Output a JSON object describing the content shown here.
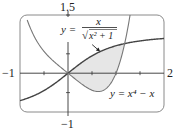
{
  "chart_data": {
    "type": "line",
    "title": "",
    "xlabel": "",
    "ylabel": "",
    "xlim": [
      -1,
      2
    ],
    "ylim": [
      -1,
      1.5
    ],
    "grid": false,
    "tick_step": 0.5,
    "tick_labels": {
      "x_left": "−1",
      "x_right": "2",
      "y_top": "1.5",
      "y_bottom": "−1"
    },
    "series": [
      {
        "name": "y = x / √(x²+1)",
        "expr": "x/sqrt(x^2+1)",
        "color": "#444444",
        "domain": [
          -1,
          2
        ]
      },
      {
        "name": "y = x⁴ − x",
        "expr": "x^4-x",
        "color": "#777777",
        "domain": [
          -0.85,
          1.33
        ]
      }
    ],
    "shaded_region": {
      "between": [
        "x/sqrt(x^2+1)",
        "x^4-x"
      ],
      "x_from": 0,
      "x_to": 1.18,
      "color": "#e6e6e6"
    },
    "annotations": [
      {
        "id": "label1",
        "text_parts": {
          "lhs": "y =",
          "num": "x",
          "den_rad": "√",
          "den_body": "x² + 1"
        },
        "arrow_to_x": 0.67
      },
      {
        "id": "label2",
        "text": "y = x⁴ − x"
      }
    ],
    "frame_color": "#8a8a8a",
    "axis_color": "#333333"
  }
}
